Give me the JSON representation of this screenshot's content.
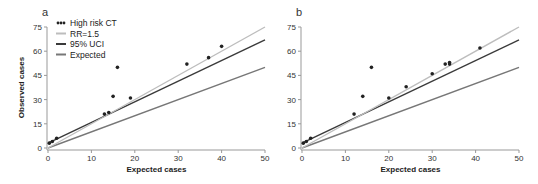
{
  "chart_data": [
    {
      "panel_label": "a",
      "type": "scatter",
      "xlabel": "Expected cases",
      "ylabel": "Observed cases",
      "xlim": [
        0,
        50
      ],
      "ylim": [
        0,
        75
      ],
      "xticks": [
        0,
        10,
        20,
        30,
        40,
        50
      ],
      "yticks": [
        0,
        15,
        30,
        45,
        60,
        75
      ],
      "grid": false,
      "legend_position": "upper-left",
      "series": [
        {
          "name": "High risk CT",
          "kind": "points",
          "color": "#222222",
          "points": [
            [
              0.3,
              3
            ],
            [
              1,
              4
            ],
            [
              2,
              6
            ],
            [
              13,
              21
            ],
            [
              14,
              22
            ],
            [
              15,
              32
            ],
            [
              16,
              50
            ],
            [
              19,
              31
            ],
            [
              32,
              52
            ],
            [
              37,
              56
            ],
            [
              40,
              63
            ]
          ]
        },
        {
          "name": "RR=1.5",
          "kind": "line",
          "color": "#bdbdbd",
          "from": [
            0,
            0
          ],
          "to": [
            50,
            75
          ]
        },
        {
          "name": "95% UCI",
          "kind": "line",
          "color": "#3a3a3a",
          "from": [
            0,
            3
          ],
          "to": [
            50,
            67
          ]
        },
        {
          "name": "Expected",
          "kind": "line",
          "color": "#777777",
          "from": [
            0,
            0
          ],
          "to": [
            50,
            50
          ]
        }
      ]
    },
    {
      "panel_label": "b",
      "type": "scatter",
      "xlabel": "Expected cases",
      "ylabel": "",
      "xlim": [
        0,
        50
      ],
      "ylim": [
        0,
        75
      ],
      "xticks": [
        0,
        10,
        20,
        30,
        40,
        50
      ],
      "yticks": [
        0,
        15,
        30,
        45,
        60,
        75
      ],
      "grid": false,
      "series": [
        {
          "name": "High risk CT",
          "kind": "points",
          "color": "#222222",
          "points": [
            [
              0.3,
              3
            ],
            [
              1,
              4
            ],
            [
              2,
              6
            ],
            [
              12,
              21
            ],
            [
              14,
              32
            ],
            [
              16,
              50
            ],
            [
              20,
              31
            ],
            [
              24,
              38
            ],
            [
              30,
              46
            ],
            [
              33,
              52
            ],
            [
              34,
              52
            ],
            [
              34,
              53
            ],
            [
              41,
              62
            ]
          ]
        },
        {
          "name": "RR=1.5",
          "kind": "line",
          "color": "#bdbdbd",
          "from": [
            0,
            0
          ],
          "to": [
            50,
            75
          ]
        },
        {
          "name": "95% UCI",
          "kind": "line",
          "color": "#3a3a3a",
          "from": [
            0,
            3
          ],
          "to": [
            50,
            67
          ]
        },
        {
          "name": "Expected",
          "kind": "line",
          "color": "#777777",
          "from": [
            0,
            0
          ],
          "to": [
            50,
            50
          ]
        }
      ]
    }
  ],
  "legend": [
    {
      "label": "High risk CT",
      "style": "dots"
    },
    {
      "label": "RR=1.5",
      "style": "line"
    },
    {
      "label": "95% UCI",
      "style": "line"
    },
    {
      "label": "Expected",
      "style": "line"
    }
  ]
}
